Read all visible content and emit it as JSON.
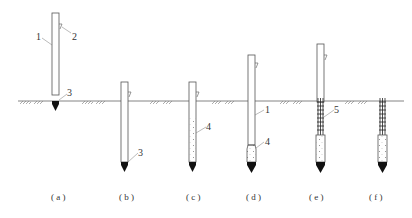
{
  "diagram": {
    "type": "construction-sequence",
    "ground_line_y": 101,
    "stages": [
      {
        "id": "a",
        "caption": "( a )"
      },
      {
        "id": "b",
        "caption": "( b )"
      },
      {
        "id": "c",
        "caption": "( c )"
      },
      {
        "id": "d",
        "caption": "( d )"
      },
      {
        "id": "e",
        "caption": "( e )"
      },
      {
        "id": "f",
        "caption": "( f )"
      }
    ],
    "labels": {
      "casing": "1",
      "hook": "2",
      "tip": "3",
      "concrete": "4",
      "rebar_cage": "5"
    },
    "colors": {
      "line": "#555555",
      "tip": "#111111",
      "background": "#ffffff"
    }
  }
}
